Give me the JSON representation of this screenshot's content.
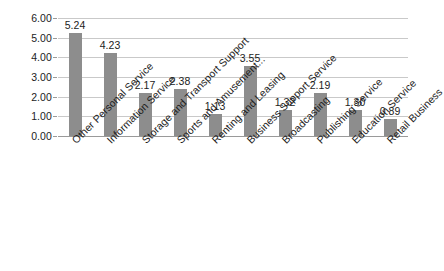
{
  "chart_data": {
    "type": "bar",
    "title": "",
    "subtitle": "",
    "xlabel": "",
    "ylabel": "",
    "ylim": [
      0,
      6
    ],
    "ytick_step": 1,
    "grid": true,
    "legend": false,
    "orientation": "vertical",
    "bar_color": "#8d8d8d",
    "gridline_color": "#c9c9c9",
    "axis_color": "#9a9a9a",
    "text_color": "#1c1c1c",
    "background_color": "#ffffff",
    "value_label_format": "0.00",
    "category_label_rotation": -45,
    "ytick_labels": [
      "6.00",
      "5.00",
      "4.00",
      "3.00",
      "2.00",
      "1.00",
      "0.00"
    ],
    "ytick_values": [
      6,
      5,
      4,
      3,
      2,
      1,
      0
    ],
    "categories": [
      "Other Personal Service",
      "Information Service",
      "Storage and Transport Support",
      "Sports and Amusement...",
      "Renting and Leasing",
      "Business Support Service",
      "Broadcasting",
      "Publishing Service",
      "Education Service",
      "Retail Business"
    ],
    "values": [
      5.24,
      4.23,
      2.17,
      2.38,
      1.13,
      3.55,
      1.32,
      2.19,
      1.3,
      0.89
    ],
    "value_labels": [
      "5.24",
      "4.23",
      "2.17",
      "2.38",
      "1.13",
      "3.55",
      "1.32",
      "2.19",
      "1.30",
      "0.89"
    ]
  }
}
